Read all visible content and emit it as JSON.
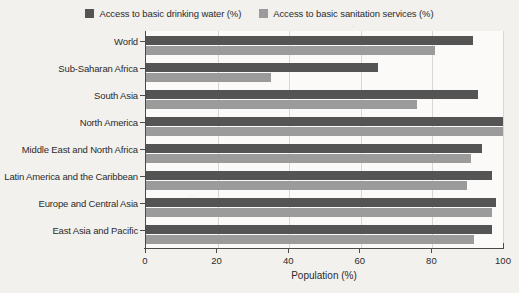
{
  "chart_data": {
    "type": "bar",
    "orientation": "horizontal",
    "title": "",
    "xlabel": "Population (%)",
    "ylabel": "",
    "xlim": [
      0,
      100
    ],
    "xticks": [
      0,
      20,
      40,
      60,
      80,
      100
    ],
    "grid": true,
    "legend_position": "top-center",
    "categories": [
      "World",
      "Sub-Saharan Africa",
      "South Asia",
      "North America",
      "Middle East and North Africa",
      "Latin America and the Caribbean",
      "Europe and Central Asia",
      "East Asia and Pacific"
    ],
    "series": [
      {
        "name": "Access to basic drinking water (%)",
        "color": "#545454",
        "values": [
          91.5,
          65,
          93,
          100,
          94,
          97,
          98,
          97
        ]
      },
      {
        "name": "Access to basic sanitation services (%)",
        "color": "#9b9b9b",
        "values": [
          81,
          35,
          76,
          100,
          91,
          90,
          97,
          92
        ]
      }
    ]
  },
  "legend": {
    "entries": [
      {
        "label": "Access to basic drinking water (%)",
        "color": "#545454"
      },
      {
        "label": "Access to basic sanitation services (%)",
        "color": "#9b9b9b"
      }
    ]
  },
  "axes": {
    "x": {
      "title": "Population (%)",
      "ticks": [
        "0",
        "20",
        "40",
        "60",
        "80",
        "100"
      ]
    },
    "y": {
      "ticks": [
        "World",
        "Sub-Saharan Africa",
        "South Asia",
        "North America",
        "Middle East and North Africa",
        "Latin America and the Caribbean",
        "Europe and Central Asia",
        "East Asia and Pacific"
      ]
    }
  }
}
